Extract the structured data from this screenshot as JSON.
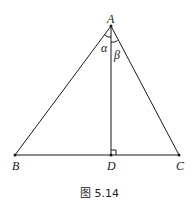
{
  "figure": {
    "caption": "图 5.14",
    "stroke_color": "#1a1a1a",
    "points": {
      "A": {
        "label": "A",
        "x": 111,
        "y": 26
      },
      "B": {
        "label": "B",
        "x": 15,
        "y": 155
      },
      "C": {
        "label": "C",
        "x": 179,
        "y": 155
      },
      "D": {
        "label": "D",
        "x": 111,
        "y": 155
      }
    },
    "angles": {
      "alpha": {
        "label": "α",
        "vertex": "A",
        "between": [
          "AB",
          "AD"
        ]
      },
      "beta": {
        "label": "β",
        "vertex": "A",
        "between": [
          "AD",
          "AC"
        ]
      }
    },
    "segments": [
      "AB",
      "AC",
      "BC",
      "AD"
    ],
    "right_angle_at": "D"
  }
}
